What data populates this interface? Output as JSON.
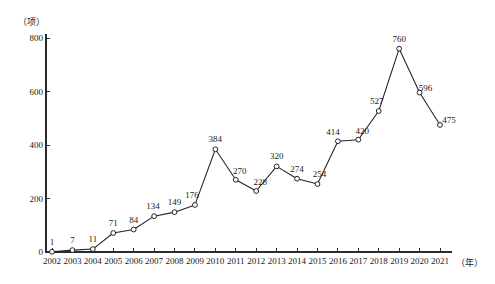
{
  "chart_data": {
    "type": "line",
    "title": "",
    "subtitle": "",
    "xlabel": "（年）",
    "ylabel": "（项）",
    "x_unit_label": "（年）",
    "y_unit_label": "（项）",
    "categories": [
      "2002",
      "2003",
      "2004",
      "2005",
      "2006",
      "2007",
      "2008",
      "2009",
      "2010",
      "2011",
      "2012",
      "2013",
      "2014",
      "2015",
      "2016",
      "2017",
      "2018",
      "2019",
      "2020",
      "2021"
    ],
    "values": [
      1,
      7,
      11,
      71,
      84,
      134,
      149,
      176,
      384,
      270,
      228,
      320,
      274,
      254,
      414,
      420,
      527,
      760,
      596,
      475
    ],
    "series": [
      {
        "name": "",
        "values": [
          1,
          7,
          11,
          71,
          84,
          134,
          149,
          176,
          384,
          270,
          228,
          320,
          274,
          254,
          414,
          420,
          527,
          760,
          596,
          475
        ]
      }
    ],
    "ylim": [
      0,
      800
    ],
    "yticks": [
      0,
      200,
      400,
      600,
      800
    ],
    "ytick_labels": [
      "0",
      "200",
      "400",
      "600",
      "800"
    ],
    "xtick_labels": [
      "2002",
      "2003",
      "2004",
      "2005",
      "2006",
      "2007",
      "2008",
      "2009",
      "2010",
      "2011",
      "2012",
      "2013",
      "2014",
      "2015",
      "2016",
      "2017",
      "2018",
      "2019",
      "2020",
      "2021"
    ],
    "data_labels": [
      "1",
      "7",
      "11",
      "71",
      "84",
      "134",
      "149",
      "176",
      "384",
      "270",
      "228",
      "320",
      "274",
      "254",
      "414",
      "420",
      "527",
      "760",
      "596",
      "475"
    ],
    "grid": false,
    "legend": false,
    "legend_position": "none",
    "marker": "circle-hollow",
    "line_color": "#222222",
    "marker_fill": "#ffffff",
    "marker_stroke": "#222222",
    "axis_color": "#2b2b2b",
    "background_color": "#ffffff"
  }
}
